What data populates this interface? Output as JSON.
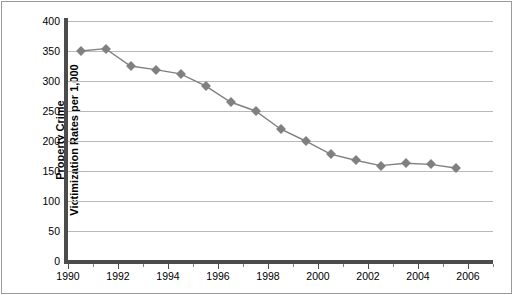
{
  "chart_data": {
    "type": "line",
    "title": "",
    "xlabel": "",
    "ylabel": "Property Crime Victimization Rates per 1,000",
    "ylabel_line1": "Property Crime",
    "ylabel_line2": "Victimization Rates per 1,000",
    "xlim": [
      1990,
      2007
    ],
    "ylim": [
      0,
      400
    ],
    "ytick_labels": [
      "400",
      "350",
      "300",
      "250",
      "200",
      "150",
      "100",
      "50",
      "0"
    ],
    "ytick_values": [
      400,
      350,
      300,
      250,
      200,
      150,
      100,
      50,
      0
    ],
    "xtick_labels": [
      "1990",
      "1992",
      "1994",
      "1996",
      "1998",
      "2000",
      "2002",
      "2004",
      "2006"
    ],
    "xtick_values": [
      1990,
      1992,
      1994,
      1996,
      1998,
      2000,
      2002,
      2004,
      2006
    ],
    "xtick_minor_values": [
      1991,
      1993,
      1995,
      1997,
      1999,
      2001,
      2003,
      2005,
      2007
    ],
    "grid": "horizontal",
    "legend": "none",
    "marker": "diamond",
    "series_color": "#808080",
    "grid_color": "#b9b9b9",
    "axis_color": "#4c4c4c",
    "x": [
      1990.5,
      1991.5,
      1992.5,
      1993.5,
      1994.5,
      1995.5,
      1996.5,
      1997.5,
      1998.5,
      1999.5,
      2000.5,
      2001.5,
      2002.5,
      2003.5,
      2004.5,
      2005.5
    ],
    "values": [
      350,
      354,
      325,
      319,
      312,
      292,
      265,
      250,
      220,
      200,
      178,
      168,
      159,
      163,
      161,
      155
    ]
  }
}
